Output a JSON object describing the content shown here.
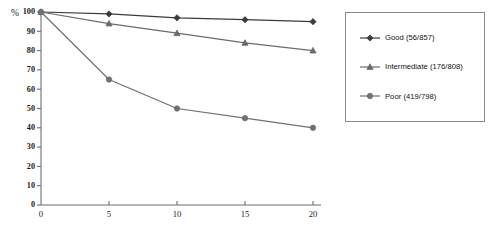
{
  "chart_data": {
    "type": "line",
    "title": "",
    "xlabel": "years",
    "ylabel": "%",
    "x": [
      0,
      5,
      10,
      15,
      20
    ],
    "xlim": [
      0,
      20
    ],
    "ylim": [
      0,
      100
    ],
    "xticks": [
      "0",
      "5",
      "10",
      "15",
      "20"
    ],
    "yticks": [
      "0",
      "10",
      "20",
      "30",
      "40",
      "50",
      "60",
      "70",
      "80",
      "90",
      "100"
    ],
    "grid": false,
    "legend_position": "right",
    "series": [
      {
        "name": "Good (56/857)",
        "label": "Good (56/857)",
        "marker": "diamond",
        "color": "#3b3b3b",
        "values": [
          100,
          99,
          97,
          96,
          95
        ]
      },
      {
        "name": "Intermediate (176/808)",
        "label": "Intermediate (176/808)",
        "marker": "triangle",
        "color": "#6b6b6b",
        "values": [
          100,
          94,
          89,
          84,
          80
        ]
      },
      {
        "name": "Poor (419/798)",
        "label": "Poor (419/798)",
        "marker": "circle",
        "color": "#707070",
        "values": [
          100,
          65,
          50,
          45,
          40
        ]
      }
    ]
  },
  "axes": {
    "y_title": "%",
    "x_title": "years"
  },
  "legend": {
    "entries": [
      {
        "label": "Good (56/857)"
      },
      {
        "label": "Intermediate (176/808)"
      },
      {
        "label": "Poor (419/798)"
      }
    ]
  }
}
